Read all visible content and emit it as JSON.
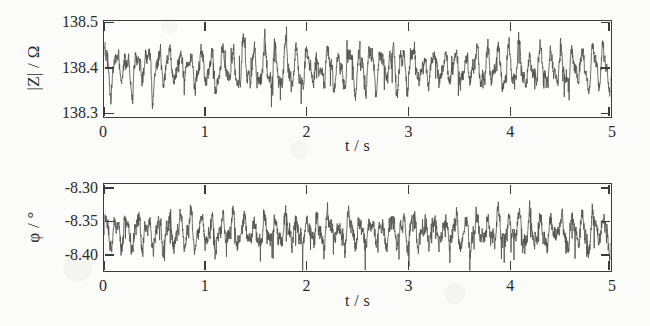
{
  "figure": {
    "background_color": "#fbfbf9",
    "ink_color": "#3b3b3b",
    "trace_color": "#555452"
  },
  "chart_data": [
    {
      "type": "line",
      "panel": "top",
      "title": "",
      "xlabel": "t / s",
      "ylabel": "|Z| / Ω",
      "xlim": [
        0,
        5
      ],
      "ylim": [
        138.29,
        138.505
      ],
      "xticks": [
        "0",
        "1",
        "2",
        "3",
        "4",
        "5"
      ],
      "xtick_values": [
        0,
        1,
        2,
        3,
        4,
        5
      ],
      "yticks": [
        "138.5",
        "138.4",
        "138.3"
      ],
      "ytick_values": [
        138.5,
        138.4,
        138.3
      ],
      "grid": false,
      "legend": null,
      "series": [
        {
          "name": "|Z|",
          "description": "noisy quasi-periodic impedance magnitude fluctuation about 138.40 ohm",
          "mean": 138.4,
          "amplitude": 0.035,
          "noise": 0.012,
          "carrier_hz": 9.6,
          "n_points": 2400,
          "seed": 1731,
          "min": 138.305,
          "max": 138.478
        }
      ]
    },
    {
      "type": "line",
      "panel": "bottom",
      "title": "",
      "xlabel": "t / s",
      "ylabel": "φ / °",
      "xlim": [
        0,
        5
      ],
      "ylim": [
        -8.425,
        -8.293
      ],
      "xticks": [
        "0",
        "1",
        "2",
        "3",
        "4",
        "5"
      ],
      "xtick_values": [
        0,
        1,
        2,
        3,
        4,
        5
      ],
      "yticks": [
        "-8.30",
        "-8.35",
        "-8.40"
      ],
      "ytick_values": [
        -8.3,
        -8.35,
        -8.4
      ],
      "grid": false,
      "legend": null,
      "series": [
        {
          "name": "φ",
          "description": "noisy quasi-periodic phase angle fluctuation about -8.365 degrees with downward spikes",
          "mean": -8.365,
          "amplitude": 0.018,
          "noise": 0.009,
          "carrier_hz": 9.6,
          "n_points": 2400,
          "seed": 904,
          "min": -8.417,
          "max": -8.318
        }
      ]
    }
  ]
}
